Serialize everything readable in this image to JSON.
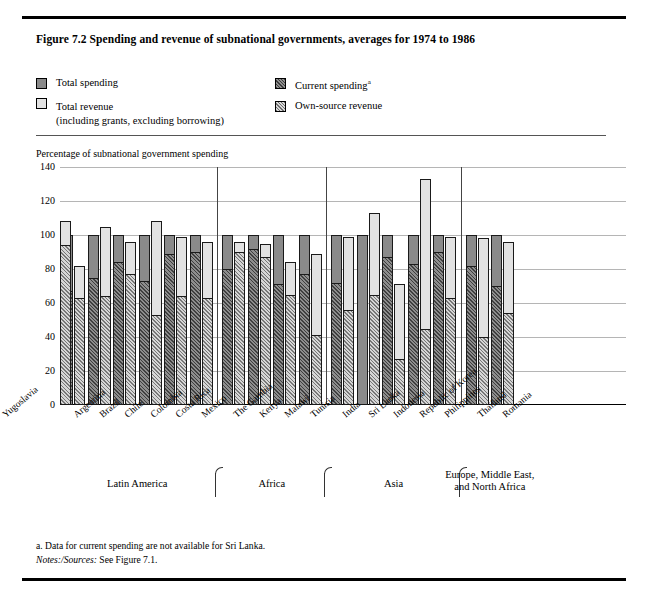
{
  "figure": {
    "title": "Figure 7.2  Spending and revenue of subnational governments, averages for 1974 to 1986",
    "axis_caption": "Percentage of subnational government spending"
  },
  "legend": {
    "items": [
      {
        "key": "total-spending",
        "label": "Total spending",
        "sub": "",
        "swatch": "solid-gray"
      },
      {
        "key": "total-revenue",
        "label": "Total revenue",
        "sub": "(including grants, excluding borrowing)",
        "swatch": "solid-lightgray"
      },
      {
        "key": "current-spending",
        "label": "Current spending",
        "sub": "",
        "swatch": "dark-hatch",
        "superscript": "a"
      },
      {
        "key": "own-source-revenue",
        "label": "Own-source revenue",
        "sub": "",
        "swatch": "light-hatch"
      }
    ]
  },
  "notes": {
    "footnote_a": "a. Data for current spending are not available for Sri Lanka.",
    "sources_label": "Notes:/Sources:",
    "sources_text": " See Figure 7.1."
  },
  "regions": [
    {
      "name": "Latin America",
      "count": 6
    },
    {
      "name": "Africa",
      "count": 4
    },
    {
      "name": "Asia",
      "count": 5
    },
    {
      "name": "Europe, Middle East,\nand North Africa",
      "count": 2
    }
  ],
  "chart_data": {
    "type": "bar",
    "title": "Figure 7.2  Spending and revenue of subnational governments, averages for 1974 to 1986",
    "xlabel": "",
    "ylabel": "Percentage of subnational government spending",
    "ylim": [
      0,
      140
    ],
    "yticks": [
      0,
      20,
      40,
      60,
      80,
      100,
      120,
      140
    ],
    "grid": true,
    "legend_position": "top",
    "categories": [
      "Argentina",
      "Brazil",
      "Chile",
      "Colombia",
      "Costa Rica",
      "Mexico",
      "The Gambia",
      "Kenya",
      "Malawi",
      "Tunisia",
      "India",
      "Sri Lanka",
      "Indonesia",
      "Republic of Korea",
      "Philippines",
      "Thailand",
      "Romania",
      "Yugoslavia"
    ],
    "series": [
      {
        "name": "Total spending",
        "values": [
          100,
          100,
          100,
          100,
          100,
          100,
          100,
          100,
          100,
          100,
          100,
          100,
          100,
          100,
          100,
          100,
          100,
          100
        ]
      },
      {
        "name": "Current spending",
        "values": [
          67,
          75,
          84,
          73,
          89,
          90,
          80,
          92,
          71,
          77,
          72,
          null,
          87,
          83,
          90,
          82,
          70,
          95
        ]
      },
      {
        "name": "Total revenue",
        "values": [
          82,
          105,
          96,
          108,
          99,
          96,
          96,
          95,
          84,
          89,
          99,
          113,
          71,
          133,
          99,
          98,
          96,
          108
        ]
      },
      {
        "name": "Own-source revenue",
        "values": [
          63,
          64,
          77,
          53,
          64,
          63,
          90,
          87,
          65,
          41,
          56,
          65,
          27,
          45,
          63,
          40,
          54,
          94
        ]
      }
    ],
    "notes": [
      "a. Data for current spending are not available for Sri Lanka."
    ]
  }
}
